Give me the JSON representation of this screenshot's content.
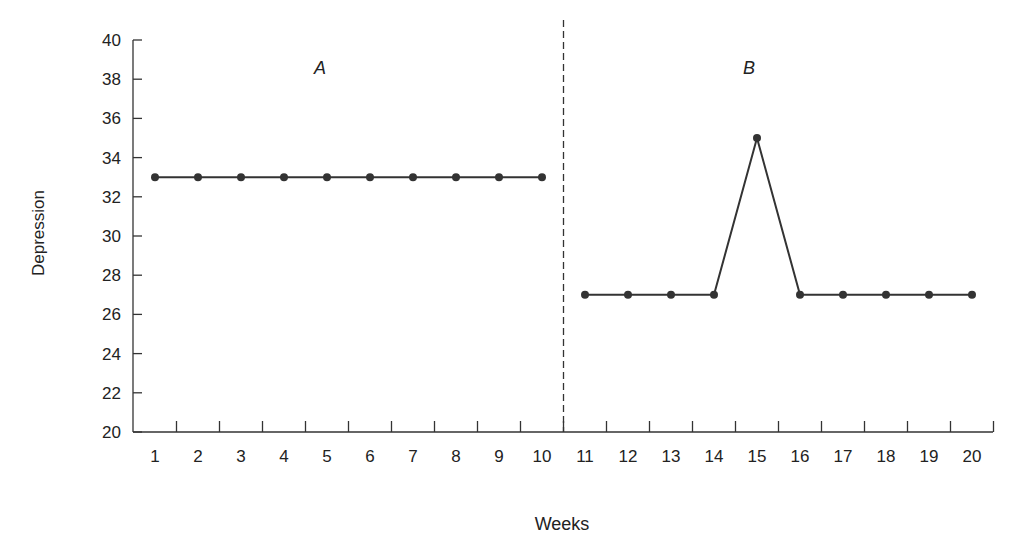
{
  "chart_data": {
    "type": "line",
    "title": "",
    "xlabel": "Weeks",
    "ylabel": "Depression",
    "ylim": [
      20,
      40
    ],
    "yticks": [
      20,
      22,
      24,
      26,
      28,
      30,
      32,
      34,
      36,
      38,
      40
    ],
    "xlim": [
      1,
      20
    ],
    "xticks": [
      1,
      2,
      3,
      4,
      5,
      6,
      7,
      8,
      9,
      10,
      11,
      12,
      13,
      14,
      15,
      16,
      17,
      18,
      19,
      20
    ],
    "grid": false,
    "legend": null,
    "phase_divider": {
      "between": [
        10,
        11
      ],
      "style": "dashed"
    },
    "phases": [
      {
        "label": "A",
        "x": [
          1,
          2,
          3,
          4,
          5,
          6,
          7,
          8,
          9,
          10
        ],
        "values": [
          33,
          33,
          33,
          33,
          33,
          33,
          33,
          33,
          33,
          33
        ]
      },
      {
        "label": "B",
        "x": [
          11,
          12,
          13,
          14,
          15,
          16,
          17,
          18,
          19,
          20
        ],
        "values": [
          27,
          27,
          27,
          27,
          35,
          27,
          27,
          27,
          27,
          27
        ]
      }
    ],
    "series": [
      {
        "name": "Depression",
        "x": [
          1,
          2,
          3,
          4,
          5,
          6,
          7,
          8,
          9,
          10,
          11,
          12,
          13,
          14,
          15,
          16,
          17,
          18,
          19,
          20
        ],
        "values": [
          33,
          33,
          33,
          33,
          33,
          33,
          33,
          33,
          33,
          33,
          27,
          27,
          27,
          27,
          35,
          27,
          27,
          27,
          27,
          27
        ]
      }
    ]
  },
  "labels": {
    "xlabel": "Weeks",
    "ylabel": "Depression",
    "phase_a": "A",
    "phase_b": "B"
  },
  "colors": {
    "line": "#333333",
    "axis": "#333333"
  }
}
